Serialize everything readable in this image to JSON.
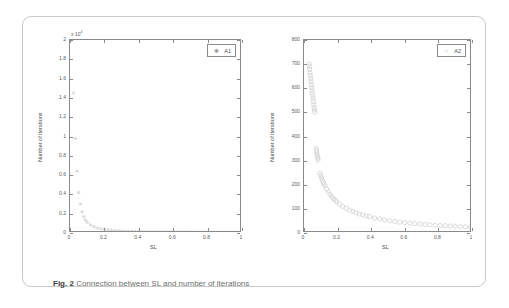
{
  "figure": {
    "caption_label": "Fig. 2",
    "caption_text": "Connection between SL and number of iterations",
    "frame_color": "#c9c9c9",
    "axis_color": "#8a8a8a",
    "marker_color": "#d6d6d6"
  },
  "chart_data": [
    {
      "type": "scatter",
      "id": "A1",
      "title": "",
      "xlabel": "SL",
      "ylabel": "Number of iterations",
      "legend": "A1",
      "legend_position": "top-right",
      "legend_marker": "asterisk",
      "marker": "*",
      "grid": false,
      "xlim": [
        0,
        1
      ],
      "ylim": [
        0,
        20000
      ],
      "y_axis_multiplier": "x 10",
      "y_axis_exponent": "4",
      "xticks": [
        0,
        0.2,
        0.4,
        0.6,
        0.8,
        1
      ],
      "xticklabels": [
        "0",
        "0.2",
        "0.4",
        "0.6",
        "0.8",
        "1"
      ],
      "yticks": [
        0,
        2000,
        4000,
        6000,
        8000,
        10000,
        12000,
        14000,
        16000,
        18000,
        20000
      ],
      "yticklabels": [
        "0",
        "0.2",
        "0.4",
        "0.6",
        "0.8",
        "1",
        "1.2",
        "1.4",
        "1.6",
        "1.8",
        "2"
      ],
      "x": [
        0.01,
        0.02,
        0.03,
        0.04,
        0.05,
        0.06,
        0.07,
        0.08,
        0.09,
        0.1,
        0.12,
        0.14,
        0.16,
        0.18,
        0.2,
        0.22,
        0.24,
        0.26,
        0.28,
        0.3,
        0.32,
        0.34,
        0.36,
        0.38,
        0.4,
        0.42,
        0.44,
        0.46,
        0.48,
        0.5,
        0.52,
        0.54,
        0.56,
        0.58,
        0.6,
        0.62,
        0.64,
        0.66,
        0.68,
        0.7,
        0.72,
        0.74,
        0.76,
        0.78,
        0.8,
        0.82,
        0.84,
        0.86,
        0.88,
        0.9,
        0.92,
        0.94,
        0.96,
        0.98,
        1.0
      ],
      "y": [
        20000,
        14500,
        9800,
        6400,
        4200,
        3000,
        2200,
        1700,
        1350,
        1100,
        820,
        640,
        520,
        430,
        370,
        320,
        285,
        255,
        230,
        210,
        195,
        180,
        168,
        157,
        148,
        140,
        133,
        126,
        120,
        115,
        110,
        106,
        102,
        98,
        95,
        92,
        89,
        86,
        84,
        81,
        79,
        77,
        75,
        73,
        72,
        70,
        68,
        67,
        66,
        64,
        63,
        62,
        61,
        60,
        59
      ]
    },
    {
      "type": "scatter",
      "id": "A2",
      "title": "",
      "xlabel": "SL",
      "ylabel": "Number of iterations",
      "legend": "A2",
      "legend_position": "top-right",
      "legend_marker": "circle",
      "marker": "o",
      "grid": false,
      "xlim": [
        0,
        1
      ],
      "ylim": [
        0,
        800
      ],
      "y_axis_multiplier": "",
      "y_axis_exponent": "",
      "xticks": [
        0,
        0.2,
        0.4,
        0.6,
        0.8,
        1
      ],
      "xticklabels": [
        "0",
        "0.2",
        "0.4",
        "0.6",
        "0.8",
        "1"
      ],
      "yticks": [
        0,
        100,
        200,
        300,
        400,
        500,
        600,
        700,
        800
      ],
      "yticklabels": [
        "0",
        "100",
        "200",
        "300",
        "400",
        "500",
        "600",
        "700",
        "800"
      ],
      "x": [
        0.03,
        0.032,
        0.034,
        0.036,
        0.038,
        0.04,
        0.042,
        0.044,
        0.046,
        0.048,
        0.05,
        0.052,
        0.054,
        0.056,
        0.058,
        0.06,
        0.062,
        0.064,
        0.072,
        0.074,
        0.076,
        0.078,
        0.08,
        0.082,
        0.084,
        0.095,
        0.1,
        0.105,
        0.11,
        0.115,
        0.12,
        0.125,
        0.135,
        0.145,
        0.155,
        0.165,
        0.175,
        0.185,
        0.195,
        0.21,
        0.23,
        0.25,
        0.27,
        0.29,
        0.31,
        0.33,
        0.35,
        0.37,
        0.39,
        0.42,
        0.45,
        0.48,
        0.51,
        0.54,
        0.57,
        0.6,
        0.63,
        0.66,
        0.69,
        0.72,
        0.75,
        0.78,
        0.81,
        0.84,
        0.87,
        0.9,
        0.93,
        0.96,
        0.99
      ],
      "y": [
        700,
        690,
        678,
        665,
        652,
        640,
        628,
        615,
        603,
        592,
        580,
        568,
        556,
        544,
        532,
        520,
        510,
        500,
        350,
        342,
        333,
        325,
        318,
        310,
        303,
        248,
        238,
        228,
        218,
        210,
        202,
        195,
        182,
        170,
        160,
        151,
        143,
        136,
        130,
        120,
        110,
        102,
        95,
        89,
        84,
        79,
        75,
        71,
        68,
        62,
        58,
        54,
        51,
        48,
        45,
        43,
        41,
        39,
        37,
        35,
        34,
        32,
        31,
        30,
        29,
        28,
        27,
        26,
        25
      ]
    }
  ]
}
